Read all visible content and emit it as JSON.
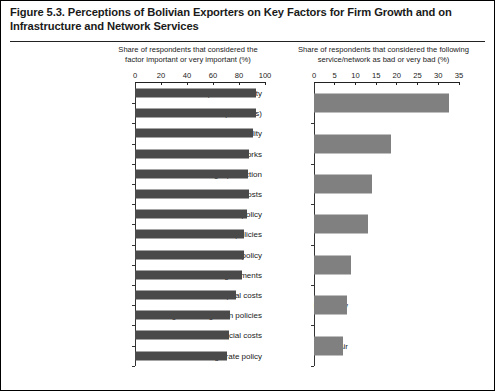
{
  "figure": {
    "title": "Figure 5.3. Perceptions of Bolivian Exporters on Key Factors for Firm Growth and on Infrastructure and Network Services"
  },
  "chart_data": [
    {
      "id": "left",
      "type": "bar",
      "orientation": "horizontal",
      "title": "Share of respondents that considered the factor important or very important (%)",
      "xlabel": "",
      "ylabel": "",
      "xlim": [
        0,
        100
      ],
      "xticks": [
        0,
        20,
        40,
        60,
        80,
        100
      ],
      "grid": false,
      "legend": "none",
      "bar_color": "#4a4a4a",
      "categories": [
        "Inputs availability",
        "Market access (overseas)",
        "Political stability",
        "Infrastructure networks",
        "Legal protection",
        "Labor costs",
        "Tax policy",
        "Drawback policies",
        "Trade policy",
        "Trade agreements",
        "Capital costs",
        "Regional Integration policies",
        "Financial costs",
        "Exchange rate policy"
      ],
      "values": [
        93,
        93,
        91,
        88,
        87,
        88,
        86,
        84,
        84,
        82,
        78,
        73,
        72,
        71
      ]
    },
    {
      "id": "right",
      "type": "bar",
      "orientation": "horizontal",
      "title": "Share of respondents that considered the following service/network as bad or very bad (%)",
      "xlabel": "",
      "ylabel": "",
      "xlim": [
        0,
        35
      ],
      "xticks": [
        0,
        5,
        10,
        15,
        20,
        25,
        30,
        35
      ],
      "grid": false,
      "legend": "none",
      "bar_color": "#808080",
      "categories": [
        "Roads",
        "Trains",
        "Water",
        "Hidrovia",
        "Telecom",
        "Electricity",
        "Air"
      ],
      "values": [
        32.5,
        18.5,
        14,
        13,
        9,
        8,
        7
      ]
    }
  ]
}
